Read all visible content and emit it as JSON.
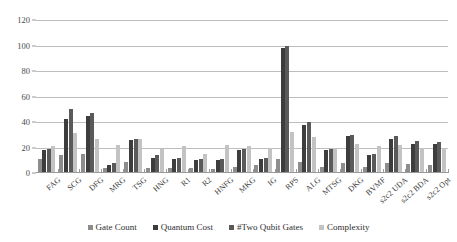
{
  "chart_data": {
    "type": "bar",
    "title": "",
    "xlabel": "",
    "ylabel": "",
    "ylim": [
      0,
      120
    ],
    "ytick_values": [
      0,
      20,
      40,
      60,
      80,
      100,
      120
    ],
    "ytick_labels": [
      "0",
      "20",
      "40",
      "60",
      "80",
      "100",
      "120"
    ],
    "grid": true,
    "legend_position": "bottom",
    "categories": [
      "FAG",
      "SCG",
      "DFG",
      "MRG",
      "TSG",
      "HNG",
      "R1",
      "R2",
      "HNFG",
      "MKG",
      "IG",
      "RPS",
      "ALG",
      "MTSG",
      "DKG",
      "BVMF",
      "s2c2 UDA",
      "s2c2 BDA",
      "s2c2 Opt"
    ],
    "series": [
      {
        "name": "Gate Count",
        "color": "#8d8d8d",
        "values": [
          11,
          14,
          15,
          4,
          9,
          4,
          4,
          4,
          3,
          5,
          6,
          11,
          9,
          5,
          8,
          5,
          8,
          7,
          6
        ]
      },
      {
        "name": "Quantum Cost",
        "color": "#3d3d3d",
        "values": [
          18,
          42,
          45,
          6,
          26,
          12,
          11,
          10,
          10,
          18,
          11,
          98,
          38,
          18,
          29,
          14,
          27,
          23,
          23
        ]
      },
      {
        "name": "#Two Qubit Gates",
        "color": "#5a5a5a",
        "values": [
          19,
          50,
          47,
          8,
          27,
          14,
          12,
          11,
          11,
          19,
          12,
          100,
          40,
          19,
          30,
          15,
          29,
          25,
          24
        ]
      },
      {
        "name": "Complexity",
        "color": "#c3c3c3",
        "values": [
          21,
          31,
          27,
          22,
          27,
          19,
          21,
          15,
          22,
          21,
          20,
          32,
          28,
          20,
          23,
          21,
          22,
          20,
          20
        ]
      }
    ]
  },
  "legend": {
    "items": [
      {
        "label": "Gate Count"
      },
      {
        "label": "Quantum Cost"
      },
      {
        "label": "#Two Qubit Gates"
      },
      {
        "label": "Complexity"
      }
    ]
  }
}
